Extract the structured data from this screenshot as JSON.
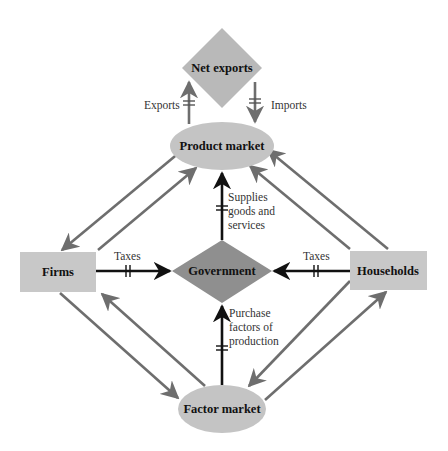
{
  "diagram": {
    "title": "",
    "nodes": {
      "net_exports": {
        "label": "Net exports",
        "shape": "diamond",
        "color": "#b9b9b9"
      },
      "product_market": {
        "label": "Product market",
        "shape": "ellipse",
        "color": "#c4c4c4"
      },
      "firms": {
        "label": "Firms",
        "shape": "rectangle",
        "color": "#c8c8c8"
      },
      "government": {
        "label": "Government",
        "shape": "diamond",
        "color": "#8f8f8f"
      },
      "households": {
        "label": "Households",
        "shape": "rectangle",
        "color": "#c8c8c8"
      },
      "factor_market": {
        "label": "Factor market",
        "shape": "ellipse",
        "color": "#c4c4c4"
      }
    },
    "edge_labels": {
      "exports": "Exports",
      "imports": "Imports",
      "taxes_firms": "Taxes",
      "taxes_households": "Taxes",
      "supplies_1": "Supplies",
      "supplies_2": "goods and",
      "supplies_3": "services",
      "purchase_1": "Purchase",
      "purchase_2": "factors of",
      "purchase_3": "production"
    },
    "edges": [
      {
        "from": "product_market",
        "to": "net_exports",
        "label": "Exports",
        "color": "#6e6e6e",
        "lagged": true
      },
      {
        "from": "net_exports",
        "to": "product_market",
        "label": "Imports",
        "color": "#6e6e6e",
        "lagged": true
      },
      {
        "from": "firms",
        "to": "government",
        "label": "Taxes",
        "color": "#111111",
        "lagged": true
      },
      {
        "from": "households",
        "to": "government",
        "label": "Taxes",
        "color": "#111111",
        "lagged": true
      },
      {
        "from": "government",
        "to": "product_market",
        "label": "Supplies goods and services",
        "color": "#111111",
        "lagged": true
      },
      {
        "from": "factor_market",
        "to": "government",
        "label": "Purchase factors of production",
        "color": "#111111",
        "lagged": true
      },
      {
        "from": "product_market",
        "to": "firms",
        "label": "",
        "color": "#6e6e6e"
      },
      {
        "from": "firms",
        "to": "product_market",
        "label": "",
        "color": "#6e6e6e"
      },
      {
        "from": "households",
        "to": "product_market",
        "label": "",
        "color": "#6e6e6e"
      },
      {
        "from": "households",
        "to": "product_market",
        "label": "",
        "color": "#6e6e6e"
      },
      {
        "from": "firms",
        "to": "factor_market",
        "label": "",
        "color": "#6e6e6e"
      },
      {
        "from": "factor_market",
        "to": "firms",
        "label": "",
        "color": "#6e6e6e"
      },
      {
        "from": "households",
        "to": "factor_market",
        "label": "",
        "color": "#6e6e6e"
      },
      {
        "from": "factor_market",
        "to": "households",
        "label": "",
        "color": "#6e6e6e"
      }
    ]
  }
}
